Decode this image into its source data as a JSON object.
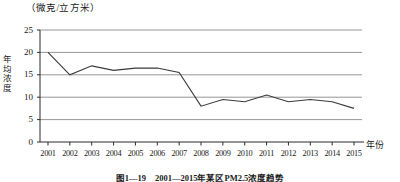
{
  "chart_data": {
    "type": "line",
    "title": "",
    "unit_label": "（微克/立方米）",
    "ylabel": "年均浓度",
    "xlabel": "年份",
    "caption": "图1—19　2001—2015年某区PM2.5浓度趋势",
    "categories": [
      "2001",
      "2002",
      "2003",
      "2004",
      "2005",
      "2006",
      "2007",
      "2008",
      "2009",
      "2010",
      "2011",
      "2012",
      "2013",
      "2014",
      "2015"
    ],
    "values": [
      20,
      15,
      17,
      16,
      16.5,
      16.5,
      15.5,
      8,
      9.5,
      9,
      10.5,
      9,
      9.5,
      9,
      7.5
    ],
    "ylim": [
      0,
      25
    ],
    "yticks": [
      "0",
      "5",
      "10",
      "15",
      "20",
      "25"
    ],
    "ytick_values": [
      0,
      5,
      10,
      15,
      20,
      25
    ],
    "grid": true,
    "legend": false,
    "line_color": "#3a3a3a",
    "grid_color": "#8a8a8a",
    "axis_color": "#2b2b2b"
  }
}
